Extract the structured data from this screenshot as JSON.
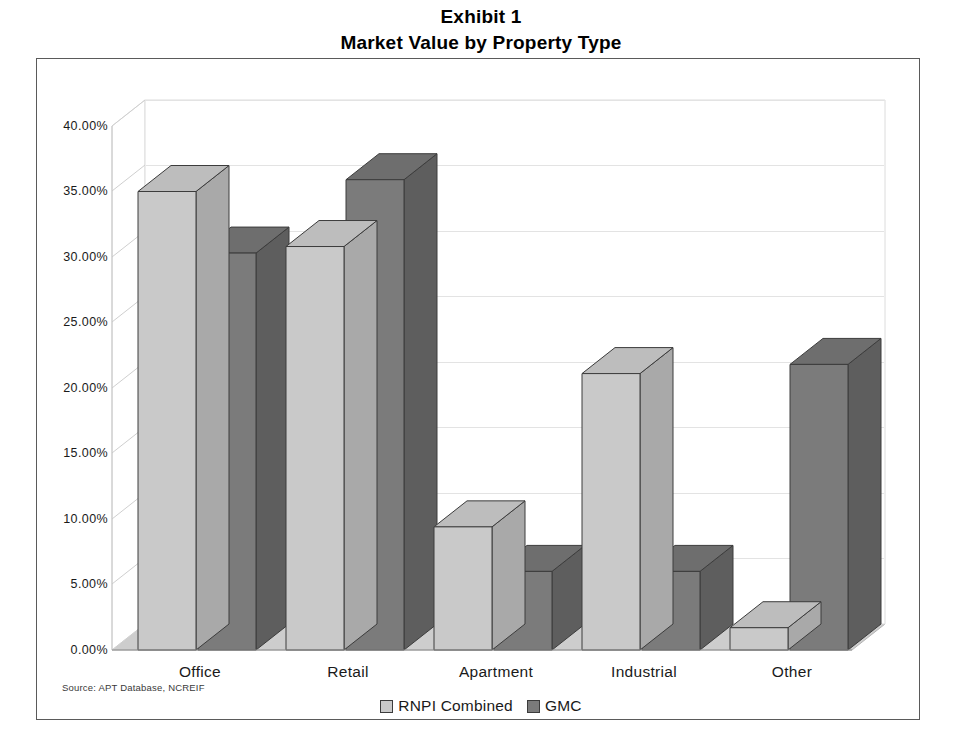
{
  "title": {
    "line1": "Exhibit 1",
    "line2": "Market Value by Property Type"
  },
  "source_note": "Source: APT Database, NCREIF",
  "colors": {
    "series_light": "#c9c9c9",
    "series_light_side": "#a9a9a9",
    "series_light_top": "#bdbdbd",
    "series_dark": "#7b7b7b",
    "series_dark_side": "#5e5e5e",
    "series_dark_top": "#6e6e6e",
    "floor": "#cdcdcd",
    "grid": "#e3e3e3",
    "frame": "#5a5a5a",
    "text": "#1a1a1a"
  },
  "legend": {
    "position": "bottom",
    "items": [
      {
        "label": "RNPI Combined",
        "swatch": "#c9c9c9"
      },
      {
        "label": "GMC",
        "swatch": "#7b7b7b"
      }
    ]
  },
  "chart_data": {
    "type": "bar",
    "title": "Market Value by Property Type",
    "subtitle": "Exhibit 1",
    "xlabel": "",
    "ylabel": "",
    "ylim": [
      0,
      40
    ],
    "ytick_labels": [
      "0.00%",
      "5.00%",
      "10.00%",
      "15.00%",
      "20.00%",
      "25.00%",
      "30.00%",
      "35.00%",
      "40.00%"
    ],
    "ytick_values": [
      0,
      5,
      10,
      15,
      20,
      25,
      30,
      35,
      40
    ],
    "grid": true,
    "three_d": true,
    "categories": [
      "Office",
      "Retail",
      "Apartment",
      "Industrial",
      "Other"
    ],
    "series": [
      {
        "name": "RNPI Combined",
        "values": [
          35.0,
          30.8,
          9.4,
          21.1,
          1.7
        ]
      },
      {
        "name": "GMC",
        "values": [
          30.3,
          35.9,
          6.0,
          6.0,
          21.8
        ]
      }
    ],
    "value_format": "percent"
  }
}
